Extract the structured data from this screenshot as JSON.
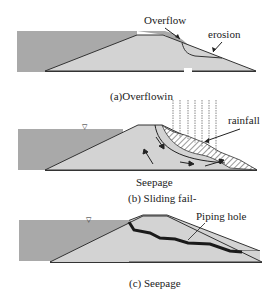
{
  "colors": {
    "water": "#a9a9a9",
    "embankment": "#d3d3d3",
    "outline": "#333333",
    "piping": "#1a1a1a",
    "background": "#ffffff"
  },
  "panels": [
    {
      "id": "a",
      "caption": "(a)Overflowin",
      "labels": {
        "overflow": "Overflow",
        "erosion": "erosion"
      }
    },
    {
      "id": "b",
      "caption": "(b)  Sliding  fail-",
      "labels": {
        "rainfall": "rainfall",
        "seepage": "Seepage"
      },
      "water_level_marker": "▽"
    },
    {
      "id": "c",
      "caption": "(c) Seepage",
      "labels": {
        "piping_hole": "Piping hole"
      },
      "water_level_marker": "▽"
    }
  ]
}
